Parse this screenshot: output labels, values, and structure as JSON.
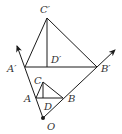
{
  "diagram": {
    "type": "geometry-homothety",
    "stroke_color": "#1a1a1a",
    "label_color": "#333333",
    "points": {
      "O": {
        "label": "O",
        "x": 43,
        "y": 118
      },
      "A": {
        "label": "A",
        "x": 36,
        "y": 98
      },
      "B": {
        "label": "B",
        "x": 63,
        "y": 98
      },
      "C": {
        "label": "C",
        "x": 43,
        "y": 82
      },
      "D": {
        "label": "D",
        "x": 43,
        "y": 98
      },
      "A1": {
        "label": "A′",
        "x": 25,
        "y": 67
      },
      "B1": {
        "label": "B′",
        "x": 97,
        "y": 67
      },
      "C1": {
        "label": "C′",
        "x": 47,
        "y": 18
      },
      "D1": {
        "label": "D′",
        "x": 47,
        "y": 67
      }
    },
    "rays": [
      {
        "from": "O",
        "through": "A1",
        "tip": {
          "x": 16,
          "y": 44
        }
      },
      {
        "from": "O",
        "through": "B1",
        "tip": {
          "x": 117,
          "y": 48
        }
      }
    ],
    "labels": {
      "O": "O",
      "A": "A",
      "B": "B",
      "C": "C",
      "D": "D",
      "A1": "A′",
      "B1": "B′",
      "C1": "C′",
      "D1": "D′"
    }
  }
}
